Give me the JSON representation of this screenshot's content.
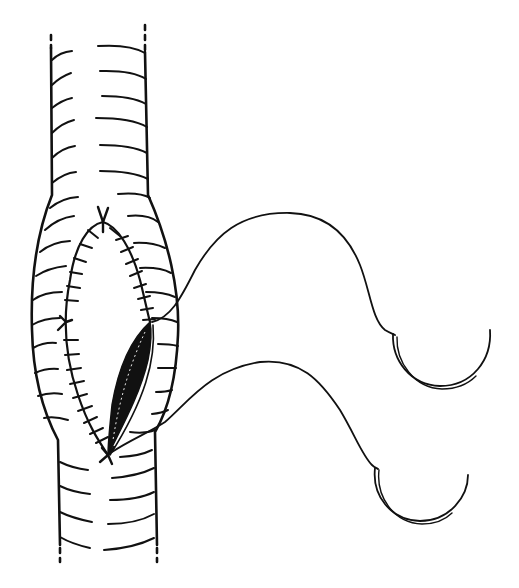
{
  "figure": {
    "description": "Line illustration of a longitudinal incision in a ringed tubular vessel being closed with a continuous suture; two curved needles with threads to the right",
    "colors": {
      "ink": "#111111",
      "background": "#ffffff"
    },
    "vessel": {
      "ring_count_left": 18,
      "ring_count_right": 18
    },
    "suture_line": {
      "stitch_count_left": 16,
      "stitch_count_right": 11,
      "knots": 3
    },
    "open_gap": {
      "fill": "#111111"
    },
    "needles": [
      {
        "name": "upper-needle"
      },
      {
        "name": "lower-needle"
      }
    ]
  }
}
